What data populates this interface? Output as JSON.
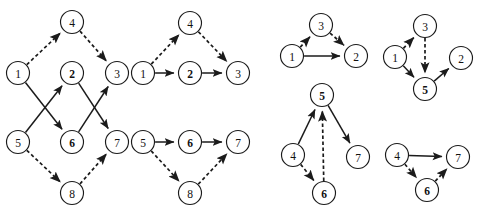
{
  "figure": {
    "title": "",
    "background_color": "#ffffff",
    "node_fill": "#ffffff",
    "stroke_color": "#1b1b1b",
    "node_radius": 11.5,
    "panels": [
      {
        "id": "panel-1",
        "nodes": [
          {
            "id": "n1",
            "label": "1",
            "x": 18,
            "y": 73,
            "bold": false
          },
          {
            "id": "n4",
            "label": "4",
            "x": 72,
            "y": 22,
            "bold": false
          },
          {
            "id": "n2",
            "label": "2",
            "x": 72,
            "y": 73,
            "bold": true
          },
          {
            "id": "n3",
            "label": "3",
            "x": 117,
            "y": 73,
            "bold": false
          },
          {
            "id": "n5",
            "label": "5",
            "x": 18,
            "y": 142,
            "bold": false
          },
          {
            "id": "n6",
            "label": "6",
            "x": 72,
            "y": 142,
            "bold": true
          },
          {
            "id": "n7",
            "label": "7",
            "x": 117,
            "y": 142,
            "bold": false
          },
          {
            "id": "n8",
            "label": "8",
            "x": 72,
            "y": 193,
            "bold": false
          }
        ],
        "edges": [
          {
            "from": "n1",
            "to": "n4",
            "style": "dashed"
          },
          {
            "from": "n4",
            "to": "n3",
            "style": "dashed"
          },
          {
            "from": "n1",
            "to": "n6",
            "style": "solid"
          },
          {
            "from": "n5",
            "to": "n2",
            "style": "solid"
          },
          {
            "from": "n2",
            "to": "n7",
            "style": "solid"
          },
          {
            "from": "n6",
            "to": "n3",
            "style": "solid"
          },
          {
            "from": "n5",
            "to": "n8",
            "style": "dashed"
          },
          {
            "from": "n8",
            "to": "n7",
            "style": "dashed"
          }
        ]
      },
      {
        "id": "panel-2",
        "nodes": [
          {
            "id": "m1",
            "label": "1",
            "x": 143,
            "y": 73,
            "bold": false
          },
          {
            "id": "m4",
            "label": "4",
            "x": 190,
            "y": 23,
            "bold": false
          },
          {
            "id": "m2",
            "label": "2",
            "x": 190,
            "y": 73,
            "bold": true
          },
          {
            "id": "m3",
            "label": "3",
            "x": 238,
            "y": 73,
            "bold": false
          },
          {
            "id": "m5",
            "label": "5",
            "x": 143,
            "y": 142,
            "bold": false
          },
          {
            "id": "m6",
            "label": "6",
            "x": 190,
            "y": 142,
            "bold": true
          },
          {
            "id": "m7",
            "label": "7",
            "x": 238,
            "y": 142,
            "bold": false
          },
          {
            "id": "m8",
            "label": "8",
            "x": 190,
            "y": 193,
            "bold": false
          }
        ],
        "edges": [
          {
            "from": "m1",
            "to": "m4",
            "style": "dashed"
          },
          {
            "from": "m4",
            "to": "m3",
            "style": "dashed"
          },
          {
            "from": "m1",
            "to": "m2",
            "style": "solid"
          },
          {
            "from": "m2",
            "to": "m3",
            "style": "solid"
          },
          {
            "from": "m5",
            "to": "m8",
            "style": "dashed"
          },
          {
            "from": "m8",
            "to": "m7",
            "style": "dashed"
          },
          {
            "from": "m5",
            "to": "m6",
            "style": "solid"
          },
          {
            "from": "m6",
            "to": "m7",
            "style": "solid"
          }
        ]
      },
      {
        "id": "panel-3",
        "nodes": [
          {
            "id": "p1",
            "label": "1",
            "x": 292,
            "y": 56,
            "bold": false
          },
          {
            "id": "p3",
            "label": "3",
            "x": 321,
            "y": 25,
            "bold": false
          },
          {
            "id": "p2",
            "label": "2",
            "x": 356,
            "y": 56,
            "bold": false
          },
          {
            "id": "p5",
            "label": "5",
            "x": 322,
            "y": 95,
            "bold": true
          },
          {
            "id": "p4",
            "label": "4",
            "x": 293,
            "y": 155,
            "bold": false
          },
          {
            "id": "p7",
            "label": "7",
            "x": 358,
            "y": 157,
            "bold": false
          },
          {
            "id": "p6",
            "label": "6",
            "x": 324,
            "y": 193,
            "bold": true
          }
        ],
        "edges": [
          {
            "from": "p1",
            "to": "p3",
            "style": "dashed"
          },
          {
            "from": "p3",
            "to": "p2",
            "style": "dashed"
          },
          {
            "from": "p1",
            "to": "p2",
            "style": "solid"
          },
          {
            "from": "p4",
            "to": "p5",
            "style": "solid"
          },
          {
            "from": "p5",
            "to": "p7",
            "style": "solid"
          },
          {
            "from": "p4",
            "to": "p6",
            "style": "dashed"
          },
          {
            "from": "p6",
            "to": "p5",
            "style": "dashed"
          }
        ]
      },
      {
        "id": "panel-4",
        "nodes": [
          {
            "id": "q1",
            "label": "1",
            "x": 395,
            "y": 57,
            "bold": false
          },
          {
            "id": "q3",
            "label": "3",
            "x": 425,
            "y": 26,
            "bold": false
          },
          {
            "id": "q2",
            "label": "2",
            "x": 461,
            "y": 58,
            "bold": false
          },
          {
            "id": "q5",
            "label": "5",
            "x": 425,
            "y": 89,
            "bold": true
          },
          {
            "id": "q4",
            "label": "4",
            "x": 397,
            "y": 155,
            "bold": false
          },
          {
            "id": "q7",
            "label": "7",
            "x": 458,
            "y": 157,
            "bold": false
          },
          {
            "id": "q6",
            "label": "6",
            "x": 427,
            "y": 190,
            "bold": true
          }
        ],
        "edges": [
          {
            "from": "q1",
            "to": "q3",
            "style": "dashed"
          },
          {
            "from": "q3",
            "to": "q5",
            "style": "dashed"
          },
          {
            "from": "q1",
            "to": "q5",
            "style": "solid"
          },
          {
            "from": "q5",
            "to": "q2",
            "style": "solid"
          },
          {
            "from": "q4",
            "to": "q7",
            "style": "solid"
          },
          {
            "from": "q4",
            "to": "q6",
            "style": "dashed"
          },
          {
            "from": "q6",
            "to": "q7",
            "style": "dashed"
          }
        ]
      }
    ]
  }
}
